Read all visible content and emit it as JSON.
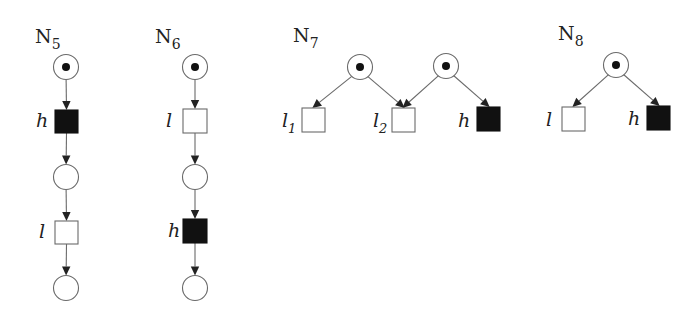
{
  "figure": {
    "type": "petri-nets",
    "colors": {
      "background": "#ffffff",
      "low_transition": "#ffffff",
      "high_transition": "#111111",
      "stroke": "#6a6a6a",
      "token": "#111111"
    }
  },
  "nets": [
    {
      "id": "N5",
      "name": "N",
      "subscript": "5",
      "label_pos": [
        35,
        43
      ],
      "places": [
        {
          "id": "p1",
          "cx": 66,
          "cy": 67,
          "marked": true
        },
        {
          "id": "p2",
          "cx": 66,
          "cy": 177,
          "marked": false
        },
        {
          "id": "p3",
          "cx": 66,
          "cy": 288,
          "marked": false
        }
      ],
      "transitions": [
        {
          "id": "t1",
          "label": "h",
          "sub": "",
          "kind": "high",
          "x": 55,
          "y": 110,
          "w": 23,
          "h": 23,
          "lx": 36,
          "ly": 127
        },
        {
          "id": "t2",
          "label": "l",
          "sub": "",
          "kind": "low",
          "x": 55,
          "y": 221,
          "w": 23,
          "h": 23,
          "lx": 39,
          "ly": 238
        }
      ],
      "arcs": [
        [
          "p1",
          "t1"
        ],
        [
          "t1",
          "p2"
        ],
        [
          "p2",
          "t2"
        ],
        [
          "t2",
          "p3"
        ]
      ]
    },
    {
      "id": "N6",
      "name": "N",
      "subscript": "6",
      "label_pos": [
        155,
        43
      ],
      "places": [
        {
          "id": "p1",
          "cx": 195,
          "cy": 67,
          "marked": true
        },
        {
          "id": "p2",
          "cx": 195,
          "cy": 177,
          "marked": false
        },
        {
          "id": "p3",
          "cx": 195,
          "cy": 288,
          "marked": false
        }
      ],
      "transitions": [
        {
          "id": "t1",
          "label": "l",
          "sub": "",
          "kind": "low",
          "x": 183,
          "y": 109,
          "w": 24,
          "h": 24,
          "lx": 166,
          "ly": 127
        },
        {
          "id": "t2",
          "label": "h",
          "sub": "",
          "kind": "high",
          "x": 183,
          "y": 219,
          "w": 24,
          "h": 24,
          "lx": 168,
          "ly": 237
        }
      ],
      "arcs": [
        [
          "p1",
          "t1"
        ],
        [
          "t1",
          "p2"
        ],
        [
          "p2",
          "t2"
        ],
        [
          "t2",
          "p3"
        ]
      ]
    },
    {
      "id": "N7",
      "name": "N",
      "subscript": "7",
      "label_pos": [
        293,
        42
      ],
      "places": [
        {
          "id": "p1",
          "cx": 360,
          "cy": 67,
          "marked": true
        },
        {
          "id": "p2",
          "cx": 446,
          "cy": 66,
          "marked": true
        }
      ],
      "transitions": [
        {
          "id": "t1",
          "label": "l",
          "sub": "1",
          "kind": "low",
          "x": 302,
          "y": 108,
          "w": 23,
          "h": 24,
          "lx": 282,
          "ly": 127
        },
        {
          "id": "t2",
          "label": "l",
          "sub": "2",
          "kind": "low",
          "x": 392,
          "y": 108,
          "w": 23,
          "h": 24,
          "lx": 373,
          "ly": 127
        },
        {
          "id": "t3",
          "label": "h",
          "sub": "",
          "kind": "high",
          "x": 477,
          "y": 107,
          "w": 23,
          "h": 24,
          "lx": 458,
          "ly": 127
        }
      ],
      "arcs": [
        [
          "p1",
          "t1"
        ],
        [
          "p1",
          "t2"
        ],
        [
          "p2",
          "t2"
        ],
        [
          "p2",
          "t3"
        ]
      ]
    },
    {
      "id": "N8",
      "name": "N",
      "subscript": "8",
      "label_pos": [
        558,
        40
      ],
      "places": [
        {
          "id": "p1",
          "cx": 616,
          "cy": 65,
          "marked": true
        }
      ],
      "transitions": [
        {
          "id": "t1",
          "label": "l",
          "sub": "",
          "kind": "low",
          "x": 562,
          "y": 107,
          "w": 23,
          "h": 24,
          "lx": 546,
          "ly": 126
        },
        {
          "id": "t2",
          "label": "h",
          "sub": "",
          "kind": "high",
          "x": 647,
          "y": 106,
          "w": 23,
          "h": 24,
          "lx": 628,
          "ly": 125
        }
      ],
      "arcs": [
        [
          "p1",
          "t1"
        ],
        [
          "p1",
          "t2"
        ]
      ]
    }
  ]
}
